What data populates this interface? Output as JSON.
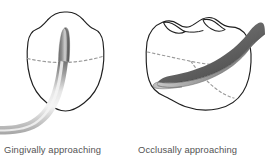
{
  "figure": {
    "background_color": "#ffffff",
    "width": 265,
    "height": 163,
    "title": ""
  },
  "palette": {
    "outline": "#1f1f1f",
    "dashed_line": "#9a9a9a",
    "instrument_dark": "#5a5a5a",
    "instrument_mid": "#8d8d8d",
    "instrument_light": "#d8d8d8",
    "instrument_highlight": "#f2f2f2",
    "caption_text": "#545454",
    "tooth_fill": "#ffffff"
  },
  "panels": [
    {
      "id": "gingival",
      "caption": "Gingivally approaching",
      "tooth_view": "facial-proximal crown outline",
      "instrument": {
        "name": "periodontal curette",
        "approach": "from gingival margin, curving upward from below",
        "shank_direction": "enters from lower-left, bends vertically",
        "blade_tip_position": "center of tooth, pointing occlusally"
      },
      "dashed_line": {
        "name": "cemento-enamel junction",
        "orientation": "horizontal across mid-crown"
      }
    },
    {
      "id": "occlusal",
      "caption": "Occlusally approaching",
      "tooth_view": "occlusal-proximal crown outline with cusps",
      "instrument": {
        "name": "periodontal curette",
        "approach": "from occlusal surface, crossing diagonally",
        "shank_direction": "enters from upper-right across the crown",
        "blade_tip_position": "left side of tooth, pointing mesially"
      },
      "dashed_line": {
        "name": "marginal ridge and developmental groove",
        "orientation": "diagonal across crown"
      }
    }
  ]
}
